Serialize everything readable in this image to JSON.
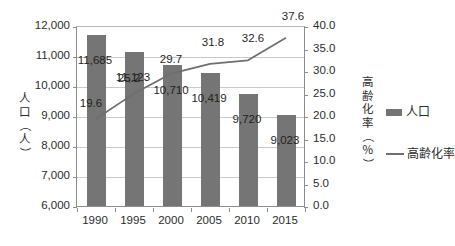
{
  "chart_data": {
    "type": "bar",
    "title": "",
    "subtitle": "",
    "categories": [
      "1990",
      "1995",
      "2000",
      "2005",
      "2010",
      "2015"
    ],
    "xlabel": "",
    "ylabel": "人口（人）",
    "y2label": "高齢化率（％）",
    "ylim": [
      6000,
      12000
    ],
    "y2lim": [
      0.0,
      40.0
    ],
    "yticks": [
      "12,000",
      "11,000",
      "10,000",
      "9,000",
      "8,000",
      "7,000",
      "6,000"
    ],
    "ytick_values": [
      12000,
      11000,
      10000,
      9000,
      8000,
      7000,
      6000
    ],
    "y2ticks": [
      "40.0",
      "35.0",
      "30.0",
      "25.0",
      "20.0",
      "15.0",
      "10.0",
      "5.0",
      "0.0"
    ],
    "y2tick_values": [
      40.0,
      35.0,
      30.0,
      25.0,
      20.0,
      15.0,
      10.0,
      5.0,
      0.0
    ],
    "grid": true,
    "legend_position": "right",
    "series": [
      {
        "name": "人口",
        "kind": "bar",
        "axis": "left",
        "color": "#757575",
        "values": [
          11685,
          11123,
          10710,
          10419,
          9720,
          9023
        ],
        "labels": [
          "11,685",
          "11,123",
          "10,710",
          "10,419",
          "9,720",
          "9,023"
        ]
      },
      {
        "name": "高齢化率",
        "kind": "line",
        "axis": "right",
        "color": "#6e6e6e",
        "values": [
          19.6,
          25.2,
          29.7,
          31.8,
          32.6,
          37.6
        ],
        "labels": [
          "19.6",
          "25.2",
          "29.7",
          "31.8",
          "32.6",
          "37.6"
        ]
      }
    ]
  },
  "legend": {
    "items": [
      {
        "label": "人口",
        "type": "bar-swatch",
        "color": "#757575"
      },
      {
        "label": "高齢化率",
        "type": "line-swatch",
        "color": "#6e6e6e"
      }
    ]
  },
  "axis_titles": {
    "left_chars": [
      "人",
      "口",
      "（",
      "人",
      "）"
    ],
    "right_chars": [
      "高",
      "齢",
      "化",
      "率",
      "（",
      "％",
      "）"
    ]
  },
  "colors": {
    "bar": "#757575",
    "line": "#6e6e6e",
    "grid": "#c9c9c9",
    "axis": "#8d8d8d",
    "text": "#2b2b2b",
    "background": "#ffffff"
  }
}
